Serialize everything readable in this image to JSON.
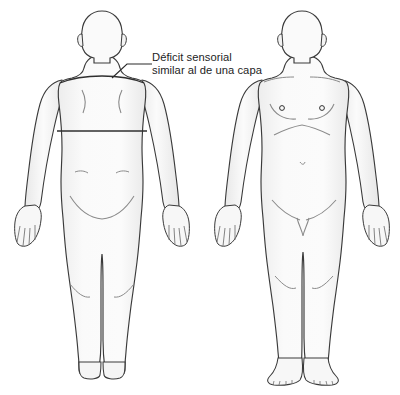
{
  "illustration": {
    "title": "Diagrama de deficit sensorial en capa",
    "background_color": "#ffffff",
    "outline_color": "#3a3a3a",
    "body_fill_color": "#fbfbfb",
    "shade_color": "#f1f1f1",
    "detail_line_color": "#7a7a7a"
  },
  "annotation": {
    "line1": "Déficit sensorial",
    "line2": "similar al de una capa",
    "leader_line_color": "#2a2a2a"
  },
  "figures": [
    {
      "id": "posterior-figure",
      "view_label": "Vista posterior",
      "position": "left",
      "markings": [
        "shoulder-boundary-line",
        "mid-back-boundary-line",
        "scapula-lines",
        "dimples-of-venus"
      ]
    },
    {
      "id": "anterior-figure",
      "view_label": "Vista anterior",
      "position": "right",
      "markings": [
        "nipples",
        "pectoral-lines",
        "rib-margin-lines",
        "navel-line"
      ]
    }
  ]
}
